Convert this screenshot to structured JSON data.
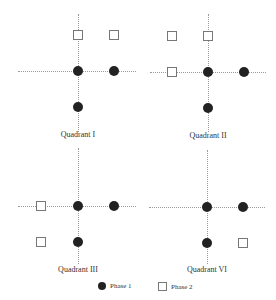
{
  "quadrants": [
    {
      "label": "Quadrant I"
    },
    {
      "label": "Quadrant II"
    },
    {
      "label": "Quadrant III"
    },
    {
      "label": "Quadrant VI"
    }
  ],
  "legend": {
    "phase1": "Phase 1",
    "phase2": "Phase 2"
  },
  "colors": {
    "phase1": "#222222",
    "phase2_border": "#777777",
    "axis": "#9a9a9a"
  }
}
